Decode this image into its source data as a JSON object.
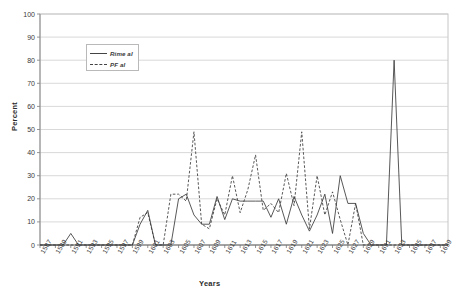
{
  "chart_data": {
    "type": "line",
    "title": "",
    "xlabel": "Years",
    "ylabel": "Percent",
    "ylim": [
      0,
      100
    ],
    "ytick_step": 10,
    "yticks": [
      100,
      90,
      80,
      70,
      60,
      50,
      40,
      30,
      20,
      10,
      0
    ],
    "grid": true,
    "grid_axis": "y",
    "legend_position": "upper-left-inside",
    "xlim": [
      1587,
      1640
    ],
    "categories": [
      1587,
      1588,
      1589,
      1590,
      1591,
      1592,
      1593,
      1594,
      1595,
      1596,
      1597,
      1598,
      1599,
      1600,
      1601,
      1602,
      1603,
      1604,
      1605,
      1606,
      1607,
      1608,
      1609,
      1610,
      1611,
      1612,
      1613,
      1614,
      1615,
      1616,
      1617,
      1618,
      1619,
      1620,
      1621,
      1622,
      1623,
      1624,
      1625,
      1626,
      1627,
      1628,
      1629,
      1630,
      1631,
      1632,
      1633,
      1634,
      1635,
      1636,
      1637,
      1638,
      1639,
      1640
    ],
    "xticks": [
      "1587",
      "1589",
      "1591",
      "1593",
      "1595",
      "1597",
      "1599",
      "1601",
      "1603",
      "1605",
      "1607",
      "1609",
      "1611",
      "1613",
      "1615",
      "1617",
      "1619",
      "1621",
      "1623",
      "1625",
      "1627",
      "1629",
      "1631",
      "1633",
      "1635",
      "1637",
      "1639"
    ],
    "series": [
      {
        "name": "Rime al",
        "style": "solid",
        "color": "#3a3a3a",
        "values": [
          0,
          0,
          0,
          0,
          5,
          0,
          0,
          0,
          0,
          0,
          0,
          0,
          0,
          9,
          15,
          0,
          0,
          0,
          20,
          22,
          13,
          9,
          9,
          21,
          11,
          20,
          19,
          19,
          19,
          19,
          12,
          20,
          9,
          21,
          13,
          6,
          13,
          22,
          5,
          30,
          18,
          18,
          5,
          0,
          0,
          0,
          80,
          0,
          0,
          0,
          0,
          0,
          0,
          0
        ]
      },
      {
        "name": "PF al",
        "style": "dashed",
        "color": "#3a3a3a",
        "values": [
          0,
          0,
          0,
          0,
          0,
          0,
          0,
          0,
          0,
          0,
          0,
          0,
          0,
          12,
          14,
          0,
          0,
          22,
          22,
          19,
          49,
          9,
          7,
          20,
          13,
          30,
          14,
          24,
          39,
          15,
          18,
          14,
          31,
          17,
          49,
          7,
          30,
          13,
          23,
          11,
          0,
          18,
          0,
          0,
          0,
          0,
          0,
          0,
          0,
          0,
          0,
          0,
          0,
          0
        ]
      }
    ]
  },
  "legend": {
    "items": [
      {
        "label": "Rime al",
        "style": "solid"
      },
      {
        "label": "PF al",
        "style": "dashed"
      }
    ]
  }
}
